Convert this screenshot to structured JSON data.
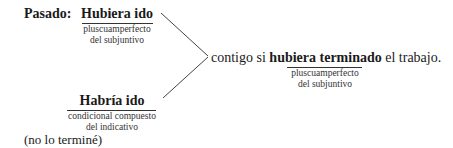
{
  "diagram": {
    "left_label": "Pasado:",
    "top_verb": {
      "text": "Hubiera ido",
      "note_line1": "pluscuamperfecto",
      "note_line2": "del subjuntivo"
    },
    "bottom_verb": {
      "text": "Habría ido",
      "note_line1": "condicional compuesto",
      "note_line2": "del indicativo"
    },
    "sentence": {
      "before": "contigo si ",
      "highlight": "hubiera terminado",
      "after": " el trabajo.",
      "note_line1": "pluscuamperfecto",
      "note_line2": "del subjuntivo"
    },
    "footnote": "(no lo terminé)"
  }
}
